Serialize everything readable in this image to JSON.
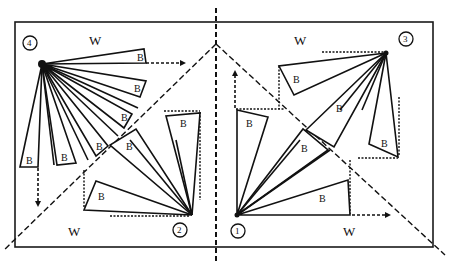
{
  "diagram": {
    "type": "wind-turbine-blade-rotation-quadrants",
    "region_label": "W",
    "blade_label": "B",
    "quadrants": [
      {
        "id": "q1",
        "number": "1",
        "region_label": "W",
        "blade_labels": [
          "B",
          "B",
          "B"
        ]
      },
      {
        "id": "q2",
        "number": "2",
        "region_label": "W",
        "blade_labels": [
          "B",
          "B",
          "B"
        ]
      },
      {
        "id": "q3",
        "number": "3",
        "region_label": "W",
        "blade_labels": [
          "B",
          "B",
          "B"
        ]
      },
      {
        "id": "q4",
        "number": "4",
        "region_label": "W",
        "blade_labels": [
          "B",
          "B",
          "B",
          "B",
          "B",
          "B"
        ]
      }
    ],
    "colors": {
      "ink": "#111111",
      "background": "#ffffff"
    }
  }
}
